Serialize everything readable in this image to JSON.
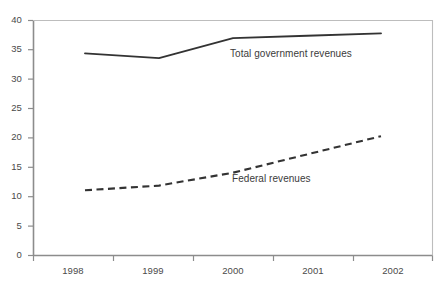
{
  "chart_data": {
    "type": "line",
    "title": "",
    "xlabel": "",
    "ylabel": "",
    "categories": [
      "1998",
      "1999",
      "2000",
      "2001",
      "2002"
    ],
    "xtick_labels": [
      "1998",
      "1999",
      "2000",
      "2001",
      "2002"
    ],
    "ytick_labels": [
      "0",
      "5",
      "10",
      "15",
      "20",
      "25",
      "30",
      "35",
      "40"
    ],
    "ytick_values": [
      0,
      5,
      10,
      15,
      20,
      25,
      30,
      35,
      40
    ],
    "ylim": [
      0,
      40
    ],
    "grid": false,
    "legend_position": "inline-annotation",
    "series": [
      {
        "name": "Total government revenues",
        "style": "solid",
        "color": "#333333",
        "values": [
          34.4,
          33.6,
          37.0,
          37.4,
          37.8
        ],
        "annotation": "Total government revenues"
      },
      {
        "name": "Federal revenues",
        "style": "dashed",
        "color": "#333333",
        "values": [
          11.1,
          11.9,
          14.1,
          17.2,
          20.3
        ],
        "annotation": "Federal revenues"
      }
    ],
    "annotations": [
      {
        "text": "Total government revenues",
        "series": "Total government revenues"
      },
      {
        "text": "Federal revenues",
        "series": "Federal revenues"
      }
    ],
    "axis_color": "#8c8c8c"
  }
}
